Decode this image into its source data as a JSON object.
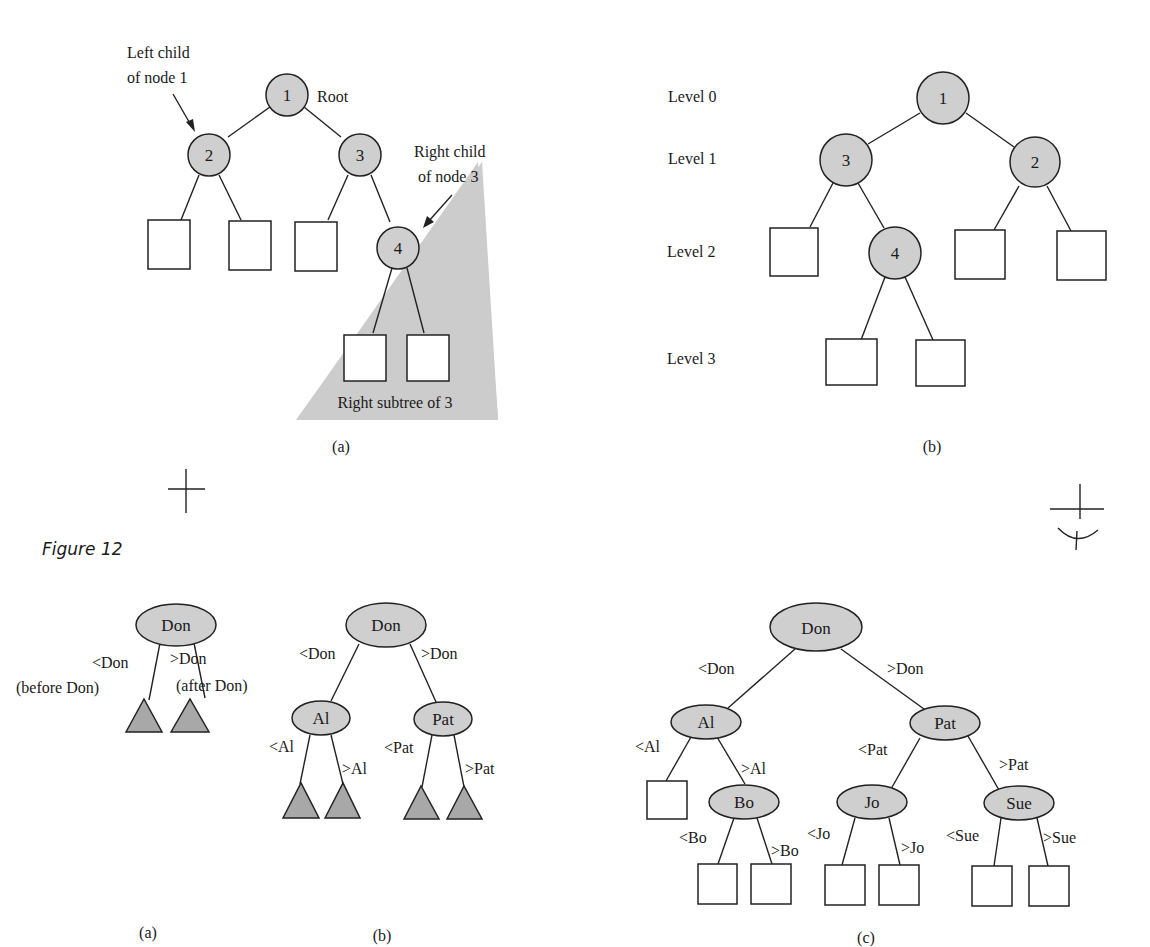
{
  "figure_title": "Figure 12",
  "top": {
    "a": {
      "caption": "(a)",
      "nodes": [
        "1",
        "2",
        "3",
        "4"
      ],
      "annotations": {
        "left_child_line1": "Left child",
        "left_child_line2": "of node 1",
        "root": "Root",
        "right_child_line1": "Right child",
        "right_child_line2": "of node 3",
        "right_subtree": "Right subtree of 3"
      }
    },
    "b": {
      "caption": "(b)",
      "nodes": [
        "1",
        "3",
        "2",
        "4"
      ],
      "levels": [
        "Level 0",
        "Level 1",
        "Level 2",
        "Level 3"
      ]
    }
  },
  "bottom": {
    "a": {
      "caption": "(a)",
      "root": "Don",
      "edge_labels": [
        "<Don",
        ">Don",
        "(before Don)",
        "(after Don)"
      ]
    },
    "b": {
      "caption": "(b)",
      "nodes": [
        "Don",
        "Al",
        "Pat"
      ],
      "edge_labels": [
        "<Don",
        ">Don",
        "<Al",
        ">Al",
        "<Pat",
        ">Pat"
      ]
    },
    "c": {
      "caption": "(c)",
      "nodes": [
        "Don",
        "Al",
        "Pat",
        "Bo",
        "Jo",
        "Sue"
      ],
      "edge_labels": [
        "<Don",
        ">Don",
        "<Al",
        ">Al",
        "<Pat",
        ">Pat",
        "<Bo",
        ">Bo",
        "<Jo",
        ">Jo",
        "<Sue",
        ">Sue"
      ]
    }
  }
}
